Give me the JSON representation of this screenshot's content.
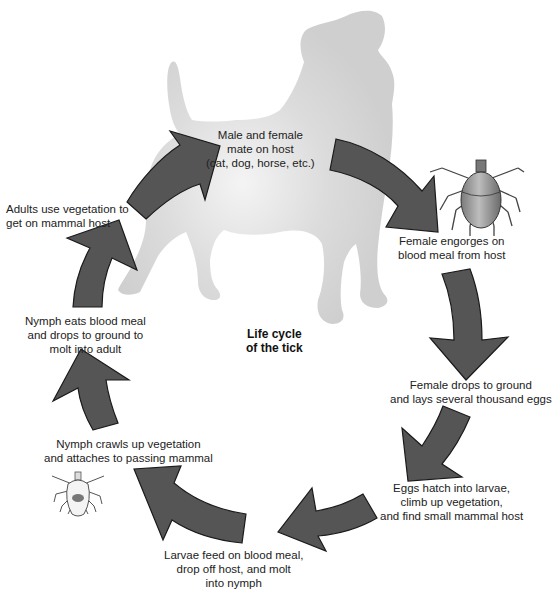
{
  "diagram": {
    "title": {
      "lines": [
        "Life cycle",
        "of the tick"
      ]
    },
    "colors": {
      "arrow_fill": "#555555",
      "arrow_stroke": "#1a1a1a",
      "silhouette": "#d2d2d2",
      "silhouette_highlight": "#f2f2f2",
      "text": "#222222",
      "background": "#ffffff"
    },
    "host_illustration": "dog-silhouette",
    "stages": [
      {
        "id": "mate",
        "lines": [
          "Male and female",
          "mate on host",
          "(cat, dog, horse, etc.)"
        ]
      },
      {
        "id": "engorge",
        "lines": [
          "Female engorges on",
          "blood meal from host"
        ],
        "icon": "engorged-female-tick-icon"
      },
      {
        "id": "lay-eggs",
        "lines": [
          "Female drops to ground",
          "and lays several thousand eggs"
        ]
      },
      {
        "id": "hatch",
        "lines": [
          "Eggs hatch into larvae,",
          "climb up vegetation,",
          "and find small mammal host"
        ]
      },
      {
        "id": "larvae-feed",
        "lines": [
          "Larvae feed on blood meal,",
          "drop off host, and molt",
          "into nymph"
        ]
      },
      {
        "id": "nymph-attach",
        "lines": [
          "Nymph crawls up vegetation",
          "and attaches to passing mammal"
        ],
        "icon": "nymph-tick-icon"
      },
      {
        "id": "nymph-molt",
        "lines": [
          "Nymph eats blood meal",
          "and drops to ground to",
          "molt into adult"
        ]
      },
      {
        "id": "adult-host",
        "lines": [
          "Adults use vegetation to",
          "get on mammal host"
        ]
      }
    ],
    "arrow_count": 8
  }
}
